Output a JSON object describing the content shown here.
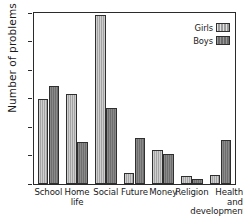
{
  "chart_data": {
    "type": "bar",
    "title": "",
    "subtitle": "",
    "xlabel": "",
    "ylabel": "Number of problems",
    "categories": [
      "School",
      "Home\nlife",
      "Social",
      "Future",
      "Money",
      "Religion",
      "Health\nand\ndevelopment"
    ],
    "series": [
      {
        "name": "Girls",
        "values": [
          149,
          158,
          297,
          19,
          59,
          14,
          16
        ],
        "color": "#b6b6b6"
      },
      {
        "name": "Boys",
        "values": [
          172,
          73,
          134,
          80,
          53,
          9,
          78
        ],
        "color": "#7c7c7c"
      }
    ],
    "ylim": [
      0,
      300
    ],
    "yticks": [
      0,
      50,
      100,
      150,
      200,
      250,
      300
    ],
    "ytick_labels": [
      "0",
      "50",
      "100",
      "150",
      "200",
      "250",
      "300"
    ],
    "grid": false,
    "legend_position": "top-right",
    "legend_entries": [
      "Girls",
      "Boys"
    ]
  },
  "legend": {
    "items": [
      {
        "label": "Girls",
        "swatch": "girls-swatch"
      },
      {
        "label": "Boys",
        "swatch": "boys-swatch"
      }
    ]
  },
  "axes": {
    "y_title": "Number of problems"
  },
  "colors": {
    "axis": "#2b2b2b",
    "text": "#1a1a1a",
    "girls": "#b6b6b6",
    "boys": "#7c7c7c",
    "background": "#ffffff"
  }
}
